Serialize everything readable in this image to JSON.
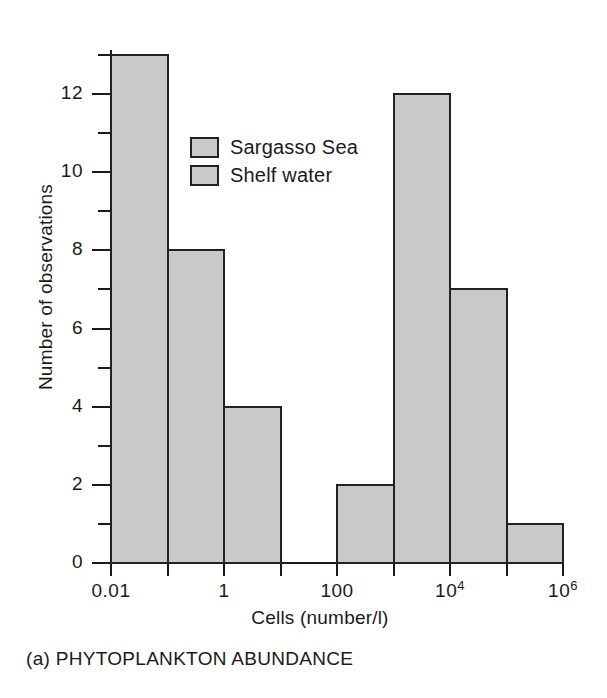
{
  "chart_data": {
    "type": "bar",
    "title": "",
    "caption": "(a) PHYTOPLANKTON ABUNDANCE",
    "xlabel": "Cells (number/l)",
    "ylabel": "Number of observations",
    "ylim": [
      0,
      13.5
    ],
    "grid": false,
    "x_scale": "log",
    "x_tick_labels": [
      "0.01",
      "",
      "1",
      "",
      "100",
      "",
      "10⁴",
      "",
      "10⁶"
    ],
    "x_tick_labels_display": [
      {
        "base": "0.01",
        "exp": ""
      },
      {
        "base": "",
        "exp": ""
      },
      {
        "base": "1",
        "exp": ""
      },
      {
        "base": "",
        "exp": ""
      },
      {
        "base": "100",
        "exp": ""
      },
      {
        "base": "",
        "exp": ""
      },
      {
        "base": "10",
        "exp": "4"
      },
      {
        "base": "",
        "exp": ""
      },
      {
        "base": "10",
        "exp": "6"
      }
    ],
    "y_tick_labels": [
      "0",
      "2",
      "4",
      "6",
      "8",
      "10",
      "12"
    ],
    "y_major_ticks": [
      0,
      2,
      4,
      6,
      8,
      10,
      12
    ],
    "y_minor_ticks": [
      1,
      3,
      5,
      7,
      9,
      11,
      13
    ],
    "legend_position": "upper-center-left",
    "series": [
      {
        "name": "Sargasso Sea",
        "color": "#c9c9c9",
        "bins": [
          {
            "bin_index": 0,
            "x_from": "0.01",
            "x_to": "0.1",
            "value": 13
          },
          {
            "bin_index": 1,
            "x_from": "0.1",
            "x_to": "1",
            "value": 8
          },
          {
            "bin_index": 2,
            "x_from": "1",
            "x_to": "10",
            "value": 4
          }
        ]
      },
      {
        "name": "Shelf water",
        "color": "#c9c9c9",
        "bins": [
          {
            "bin_index": 4,
            "x_from": "100",
            "x_to": "1000",
            "value": 2
          },
          {
            "bin_index": 5,
            "x_from": "1000",
            "x_to": "10⁴",
            "value": 12
          },
          {
            "bin_index": 6,
            "x_from": "10⁴",
            "x_to": "10⁵",
            "value": 7
          },
          {
            "bin_index": 7,
            "x_from": "10⁵",
            "x_to": "10⁶",
            "value": 1
          }
        ]
      }
    ],
    "bars": [
      {
        "bin_index": 0,
        "value": 13,
        "series": "Sargasso Sea"
      },
      {
        "bin_index": 1,
        "value": 8,
        "series": "Sargasso Sea"
      },
      {
        "bin_index": 2,
        "value": 4,
        "series": "Sargasso Sea"
      },
      {
        "bin_index": 3,
        "value": 0,
        "series": "Sargasso Sea"
      },
      {
        "bin_index": 4,
        "value": 2,
        "series": "Shelf water"
      },
      {
        "bin_index": 5,
        "value": 12,
        "series": "Shelf water"
      },
      {
        "bin_index": 6,
        "value": 7,
        "series": "Shelf water"
      },
      {
        "bin_index": 7,
        "value": 1,
        "series": "Shelf water"
      }
    ],
    "legend": [
      {
        "label": "Sargasso Sea",
        "color": "#c9c9c9"
      },
      {
        "label": "Shelf water",
        "color": "#c9c9c9"
      }
    ]
  },
  "colors": {
    "bar_fill": "#c9c9c9",
    "bar_stroke": "#222222",
    "axis": "#1a1a1a",
    "background": "#ffffff",
    "text": "#1a1a1a"
  }
}
